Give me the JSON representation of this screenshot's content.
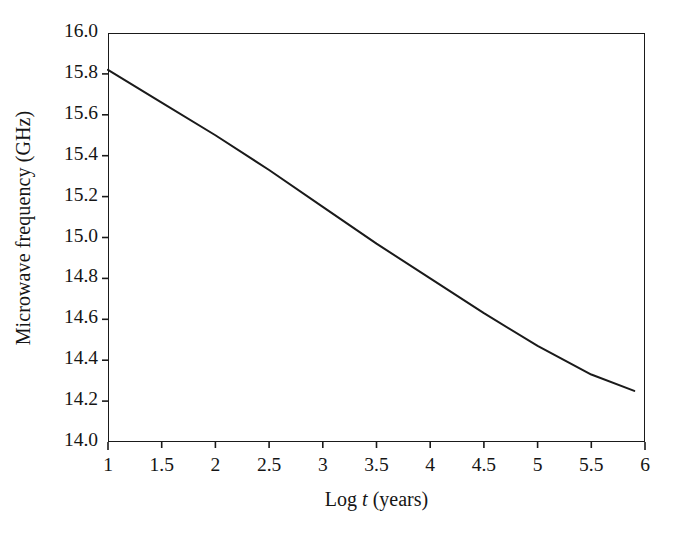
{
  "chart_data": {
    "type": "line",
    "title": "",
    "xlabel": "Log t (years)",
    "xlabel_parts": {
      "pre": "Log ",
      "italic": "t",
      "post": " (years)"
    },
    "ylabel": "Microwave frequency (GHz)",
    "xlim": [
      1,
      6
    ],
    "ylim": [
      14.0,
      16.0
    ],
    "xticks": [
      1,
      1.5,
      2,
      2.5,
      3,
      3.5,
      4,
      4.5,
      5,
      5.5,
      6
    ],
    "xtick_labels": [
      "1",
      "1.5",
      "2",
      "2.5",
      "3",
      "3.5",
      "4",
      "4.5",
      "5",
      "5.5",
      "6"
    ],
    "yticks": [
      14.0,
      14.2,
      14.4,
      14.6,
      14.8,
      15.0,
      15.2,
      15.4,
      15.6,
      15.8,
      16.0
    ],
    "ytick_labels": [
      "14.0",
      "14.2",
      "14.4",
      "14.6",
      "14.8",
      "15.0",
      "15.2",
      "15.4",
      "15.6",
      "15.8",
      "16.0"
    ],
    "grid": false,
    "legend": null,
    "frame": "full-box",
    "tick_direction": "out",
    "series": [
      {
        "name": "Microwave frequency vs log time",
        "color": "#1a1a1a",
        "line_width": 2.0,
        "markers": false,
        "x": [
          1.0,
          1.5,
          2.0,
          2.5,
          3.0,
          3.5,
          4.0,
          4.5,
          5.0,
          5.5,
          5.9
        ],
        "y": [
          15.82,
          15.66,
          15.5,
          15.33,
          15.15,
          14.97,
          14.8,
          14.63,
          14.47,
          14.33,
          14.25
        ]
      }
    ]
  },
  "axes": {
    "y_title": "Microwave frequency (GHz)",
    "x_title": "Log t (years)"
  }
}
